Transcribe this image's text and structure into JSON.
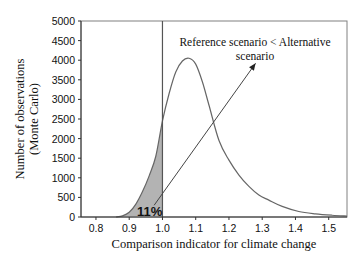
{
  "chart_data": {
    "type": "line",
    "title": "",
    "xlabel": "Comparison indicator for climate change",
    "ylabel": "Number of observations (Monte Carlo)",
    "ylabel_lines": [
      "Number of observations",
      "(Monte Carlo)"
    ],
    "xlim": [
      0.755,
      1.555
    ],
    "ylim": [
      0,
      5000
    ],
    "x_ticks": [
      0.8,
      0.9,
      1.0,
      1.1,
      1.2,
      1.3,
      1.4,
      1.5
    ],
    "x_tick_labels": [
      "0.8",
      "0.9",
      "1.0",
      "1.1",
      "1.2",
      "1.3",
      "1.4",
      "1.5"
    ],
    "y_ticks": [
      0,
      500,
      1000,
      1500,
      2000,
      2500,
      3000,
      3500,
      4000,
      4500,
      5000
    ],
    "y_tick_labels": [
      "0",
      "500",
      "1000",
      "1500",
      "2000",
      "2500",
      "3000",
      "3500",
      "4000",
      "4500",
      "5000"
    ],
    "grid": false,
    "legend": null,
    "series": [
      {
        "name": "Distribution of comparison indicator",
        "x": [
          0.86,
          0.88,
          0.9,
          0.92,
          0.94,
          0.96,
          0.98,
          1.0,
          1.02,
          1.04,
          1.06,
          1.08,
          1.1,
          1.12,
          1.14,
          1.17,
          1.2,
          1.23,
          1.26,
          1.29,
          1.32,
          1.36,
          1.41,
          1.46,
          1.51,
          1.555
        ],
        "y": [
          0,
          30,
          120,
          330,
          650,
          1050,
          1550,
          2450,
          3150,
          3700,
          3980,
          4050,
          3900,
          3450,
          2850,
          1950,
          1450,
          1070,
          780,
          560,
          430,
          270,
          140,
          80,
          45,
          25
        ]
      }
    ],
    "shaded_region": {
      "x_from": 0.86,
      "x_to": 1.0,
      "fill": "#b3b3b3",
      "label": "11%"
    },
    "reference_line": {
      "x": 1.0
    },
    "annotations": [
      {
        "text_lines": [
          "Reference scenario < Alternative",
          "scenario"
        ],
        "arrow_from": [
          0.975,
          300
        ],
        "arrow_to": [
          1.28,
          3920
        ]
      }
    ]
  }
}
